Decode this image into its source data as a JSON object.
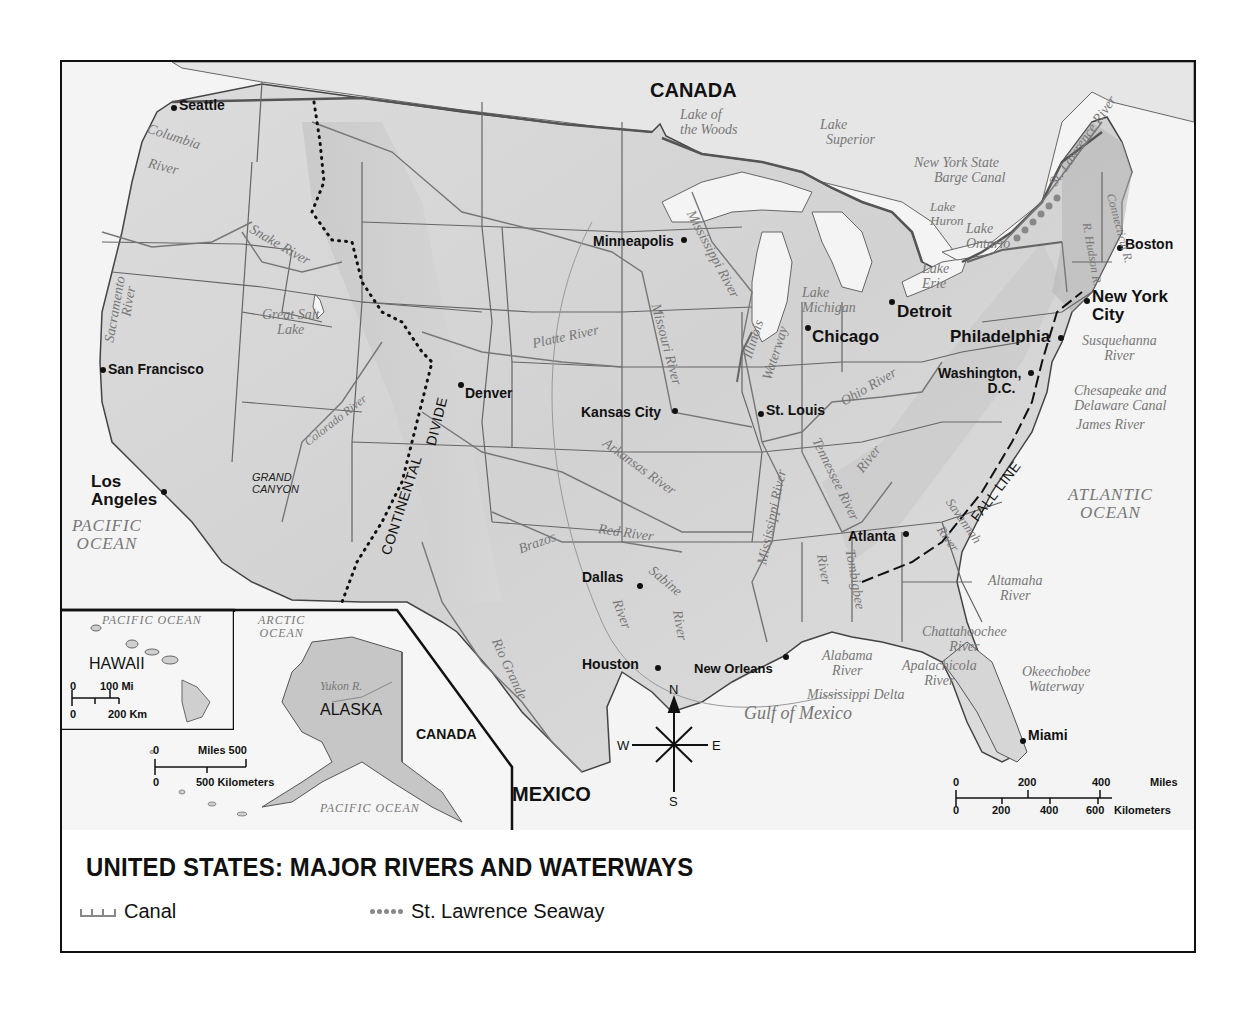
{
  "title": "UNITED STATES: MAJOR RIVERS AND WATERWAYS",
  "legend": {
    "items": [
      {
        "symbol": "canal-line",
        "label": "Canal"
      },
      {
        "symbol": "dotted-seaway",
        "label": "St. Lawrence Seaway"
      }
    ]
  },
  "countries": {
    "canada_north": "CANADA",
    "mexico": "MEXICO",
    "canada_inset": "CANADA"
  },
  "oceans": {
    "pacific_main_line1": "PACIFIC",
    "pacific_main_line2": "OCEAN",
    "atlantic_line1": "ATLANTIC",
    "atlantic_line2": "OCEAN",
    "gulf": "Gulf of Mexico",
    "hawaii_pacific": "PACIFIC OCEAN",
    "arctic_line1": "ARCTIC",
    "arctic_line2": "OCEAN",
    "alaska_pacific": "PACIFIC OCEAN"
  },
  "cities": [
    {
      "name": "Seattle"
    },
    {
      "name": "San Francisco"
    },
    {
      "name": "Los Angeles"
    },
    {
      "name": "Denver"
    },
    {
      "name": "Minneapolis"
    },
    {
      "name": "Kansas City"
    },
    {
      "name": "St. Louis"
    },
    {
      "name": "Chicago"
    },
    {
      "name": "Detroit"
    },
    {
      "name": "Dallas"
    },
    {
      "name": "Houston"
    },
    {
      "name": "New Orleans"
    },
    {
      "name": "Atlanta"
    },
    {
      "name": "Miami"
    },
    {
      "name": "Philadelphia"
    },
    {
      "name": "Washington, D.C."
    },
    {
      "name": "New York City"
    },
    {
      "name": "Boston"
    }
  ],
  "city_labels": {
    "los_angeles_1": "Los",
    "los_angeles_2": "Angeles",
    "washington_1": "Washington,",
    "washington_2": "D.C.",
    "nyc_1": "New York",
    "nyc_2": "City"
  },
  "waterways": {
    "columbia_1": "Columbia",
    "columbia_2": "River",
    "snake": "Snake River",
    "sacramento_1": "Sacramento",
    "sacramento_2": "River",
    "great_salt_1": "Great Salt",
    "great_salt_2": "Lake",
    "colorado": "Colorado River",
    "platte": "Platte River",
    "missouri": "Missouri River",
    "mississippi_upper": "Mississippi River",
    "mississippi_lower": "Mississippi River",
    "illinois_1": "Illinois",
    "illinois_2": "Waterway",
    "ohio": "Ohio River",
    "arkansas": "Arkansas River",
    "red": "Red River",
    "brazos": "Brazos",
    "sabine_1": "Sabine",
    "sabine_2": "River",
    "river_generic": "River",
    "rio_grande": "Rio Grande",
    "tennessee": "Tennessee River",
    "tombigbee_1": "Tombigbee",
    "tombigbee_2": "River",
    "savannah_1": "Savannah",
    "savannah_2": "River",
    "altamaha_1": "Altamaha",
    "altamaha_2": "River",
    "chattahoochee_1": "Chattahoochee",
    "chattahoochee_2": "River",
    "alabama_1": "Alabama",
    "alabama_2": "River",
    "apalachicola_1": "Apalachicola",
    "apalachicola_2": "River",
    "okeechobee_1": "Okeechobee",
    "okeechobee_2": "Waterway",
    "mississippi_delta": "Mississippi Delta",
    "lake_woods_1": "Lake of",
    "lake_woods_2": "the Woods",
    "lake_superior_1": "Lake",
    "lake_superior_2": "Superior",
    "ny_barge_1": "New York State",
    "ny_barge_2": "Barge Canal",
    "lake_huron_1": "Lake",
    "lake_huron_2": "Huron",
    "lake_ontario_1": "Lake",
    "lake_ontario_2": "Ontario",
    "lake_erie_1": "Lake",
    "lake_erie_2": "Erie",
    "lake_michigan_1": "Lake",
    "lake_michigan_2": "Michigan",
    "st_lawrence": "St. Lawrence River",
    "hudson": "R. Hudson R.",
    "connecticut": "Connecticut R.",
    "susquehanna_1": "Susquehanna",
    "susquehanna_2": "River",
    "chesapeake_1": "Chesapeake and",
    "chesapeake_2": "Delaware Canal",
    "james": "James River",
    "yukon": "Yukon R."
  },
  "features": {
    "continental": "CONTINENTAL",
    "divide": "DIVIDE",
    "fall_line": "FALL LINE",
    "grand_canyon_1": "GRAND",
    "grand_canyon_2": "CANYON"
  },
  "insets": {
    "hawaii": {
      "label": "HAWAII",
      "scale_mi_0": "0",
      "scale_mi": "100 Mi",
      "scale_km_0": "0",
      "scale_km": "200 Km"
    },
    "alaska": {
      "label": "ALASKA",
      "scale_mi_0": "0",
      "scale_mi": "Miles 500",
      "scale_km_0": "0",
      "scale_km": "500 Kilometers"
    }
  },
  "scale": {
    "miles": [
      "0",
      "200",
      "400"
    ],
    "miles_unit": "Miles",
    "km": [
      "0",
      "200",
      "400",
      "600"
    ],
    "km_unit": "Kilometers"
  },
  "compass": {
    "n": "N",
    "s": "S",
    "e": "E",
    "w": "W"
  },
  "colors": {
    "land": "#d9d9d9",
    "water": "#f4f4f4",
    "border": "#555555",
    "river": "#8a8a8a",
    "text": "#111111",
    "water_text": "#777777"
  }
}
